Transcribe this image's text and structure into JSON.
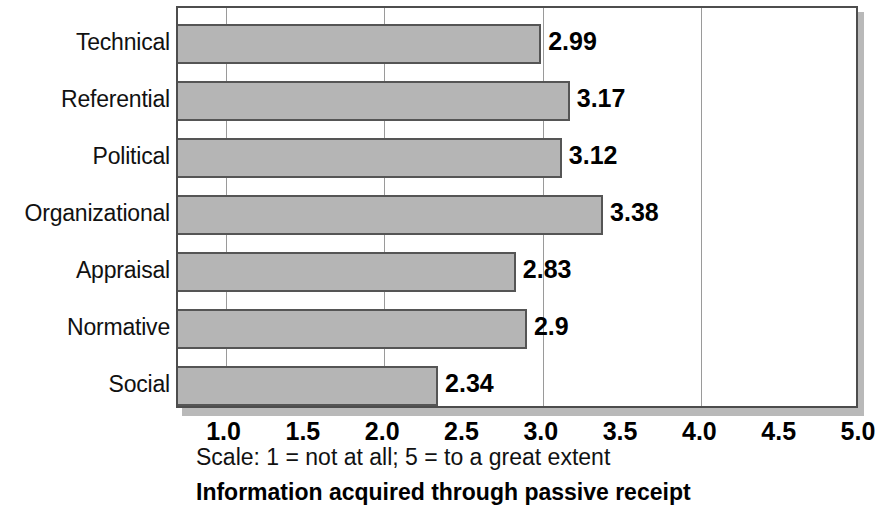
{
  "chart_data": {
    "type": "bar",
    "orientation": "horizontal",
    "title": "Information acquired through passive receipt",
    "subtitle": "Scale: 1 = not at all; 5 = to a great extent",
    "xlabel": "",
    "ylabel": "",
    "categories": [
      "Technical",
      "Referential",
      "Political",
      "Organizational",
      "Appraisal",
      "Normative",
      "Social"
    ],
    "values": [
      2.99,
      3.17,
      3.12,
      3.38,
      2.83,
      2.9,
      2.34
    ],
    "value_labels": [
      "2.99",
      "3.17",
      "3.12",
      "3.38",
      "2.83",
      "2.9",
      "2.34"
    ],
    "xlim": [
      0.7,
      5.0
    ],
    "xticks": [
      1.0,
      1.5,
      2.0,
      2.5,
      3.0,
      3.5,
      4.0,
      4.5,
      5.0
    ],
    "xtick_labels": [
      "1.0",
      "1.5",
      "2.0",
      "2.5",
      "3.0",
      "3.5",
      "4.0",
      "4.5",
      "5.0"
    ],
    "gridlines_x": [
      1.0,
      2.0,
      3.0,
      4.0
    ],
    "grid": true,
    "legend": false,
    "bar_color": "#b5b5b5",
    "bar_border_color": "#555555",
    "axis_color": "#4d4d4d",
    "grid_color": "#9a9a9a"
  },
  "captions": {
    "scale_note": "Scale: 1 = not at all; 5 = to a great extent",
    "figure_title": "Information acquired through passive receipt"
  }
}
